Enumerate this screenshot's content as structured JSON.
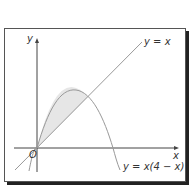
{
  "diagram": {
    "axes": {
      "x_label": "x",
      "y_label": "y",
      "origin_label": "O"
    },
    "curves": [
      {
        "name": "line",
        "label": "y = x"
      },
      {
        "name": "parabola",
        "label": "y = x(4 − x)"
      }
    ],
    "shaded_region": "area between y = x(4 − x) and y = x",
    "colors": {
      "axis": "#444444",
      "curve": "#999999",
      "shade": "#e6e6e6",
      "frame_shadow": "#222222"
    }
  }
}
